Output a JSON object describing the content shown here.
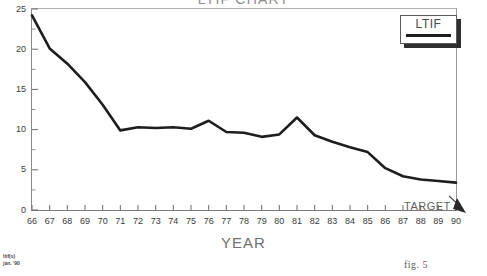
{
  "figure": {
    "title": "LTIF CHART",
    "caption": "fig. 5",
    "footnote_line1": "ltif(s)",
    "footnote_line2": "jan. '90"
  },
  "legend": {
    "label": "LTIF",
    "position": "top-right",
    "swatch_color": "#1d1d1d"
  },
  "annotations": [
    {
      "name": "target-annotation",
      "text": "TARGET",
      "points_to_year": 90,
      "points_to_value": 3.4
    }
  ],
  "axes": {
    "y": {
      "label": "",
      "ticks": [
        0,
        5,
        10,
        15,
        20,
        25
      ],
      "minor_ticks": [
        2.5,
        7.5,
        12.5,
        17.5,
        22.5
      ],
      "range": [
        0,
        25
      ]
    },
    "x": {
      "label": "YEAR",
      "ticks": [
        66,
        67,
        68,
        69,
        70,
        71,
        72,
        73,
        74,
        75,
        76,
        77,
        78,
        79,
        80,
        81,
        82,
        83,
        84,
        85,
        86,
        87,
        88,
        89,
        90
      ],
      "range": [
        66,
        90
      ]
    }
  },
  "chart_data": {
    "type": "line",
    "title": "LTIF CHART",
    "xlabel": "YEAR",
    "ylabel": "",
    "xlim": [
      66,
      90
    ],
    "ylim": [
      0,
      25
    ],
    "grid": false,
    "legend_position": "top-right",
    "x": [
      66,
      67,
      68,
      69,
      70,
      71,
      72,
      73,
      74,
      75,
      76,
      77,
      78,
      79,
      80,
      81,
      82,
      83,
      84,
      85,
      86,
      87,
      88,
      89,
      90
    ],
    "categories": [
      "66",
      "67",
      "68",
      "69",
      "70",
      "71",
      "72",
      "73",
      "74",
      "75",
      "76",
      "77",
      "78",
      "79",
      "80",
      "81",
      "82",
      "83",
      "84",
      "85",
      "86",
      "87",
      "88",
      "89",
      "90"
    ],
    "series": [
      {
        "name": "LTIF",
        "color": "#1d1d1d",
        "values": [
          24.2,
          20.1,
          18.2,
          15.9,
          13.1,
          9.9,
          10.3,
          10.2,
          10.3,
          10.1,
          11.1,
          9.7,
          9.6,
          9.1,
          9.4,
          11.5,
          9.3,
          8.5,
          7.8,
          7.2,
          5.2,
          4.2,
          3.8,
          3.6,
          3.4
        ]
      }
    ]
  }
}
